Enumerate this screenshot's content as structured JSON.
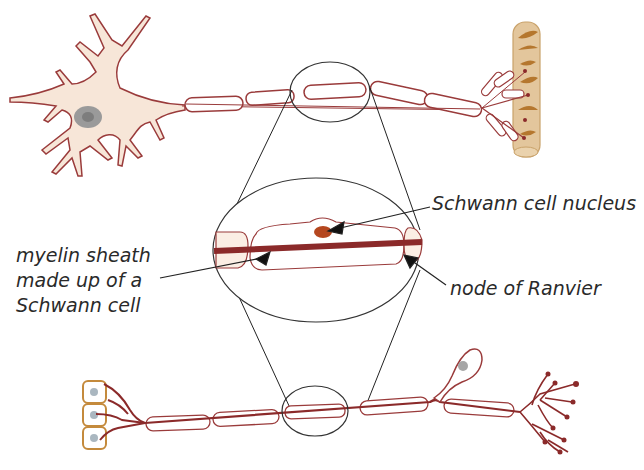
{
  "diagram": {
    "labels": {
      "schwann_nucleus": "Schwann cell nucleus",
      "node_of_ranvier": "node of Ranvier",
      "myelin_line1": "myelin sheath",
      "myelin_line2": "made up of a",
      "myelin_line3": "Schwann cell"
    },
    "components": [
      "motor-neuron-cell-body",
      "myelinated-axon-top",
      "muscle-fiber",
      "magnified-view",
      "sensory-neuron-bottom",
      "sensory-receptors",
      "axon-terminals"
    ],
    "colors": {
      "cell_fill": "#f7e6d8",
      "cell_outline": "#9a3b3b",
      "axon": "#8b2a2a",
      "nucleus": "#9a9a9a",
      "muscle": "#d9b98a",
      "muscle_striation": "#b5772e",
      "receptor_outline": "#c48a3c",
      "guide_line": "#222222"
    }
  }
}
